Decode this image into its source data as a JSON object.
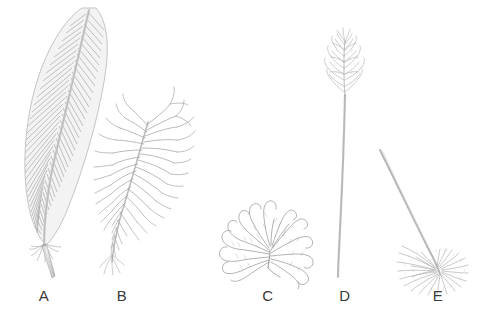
{
  "figure": {
    "background_color": "#ffffff",
    "ink_color": "#8d8d8d",
    "ink_dark_color": "#6f6f6f",
    "shaft_color": "#b9b9b9",
    "label_color": "#3b3b3b",
    "width": 490,
    "height": 319
  },
  "specimens": [
    {
      "label": "A",
      "name": "contour-feather",
      "description": "Long pennaceous contour feather with closed vane, curving rachis and bare calamus",
      "label_x": 44,
      "label_y": 295
    },
    {
      "label": "B",
      "name": "semiplume-feather",
      "description": "Semiplume with loose open plumulaceous barbs radiating from a distinct rachis",
      "label_x": 122,
      "label_y": 295
    },
    {
      "label": "C",
      "name": "down-feather",
      "description": "Down feather with short quill and curling barbs splayed into a rounded tuft",
      "label_x": 268,
      "label_y": 295
    },
    {
      "label": "D",
      "name": "filoplume-feather",
      "description": "Filoplume with long bare shaft topped by a small feathery tuft of barbs",
      "label_x": 345,
      "label_y": 295
    },
    {
      "label": "E",
      "name": "bristle-feather",
      "description": "Bristle with stiff bare curving shaft rising from a basal fan of short barbs",
      "label_x": 438,
      "label_y": 295
    }
  ]
}
